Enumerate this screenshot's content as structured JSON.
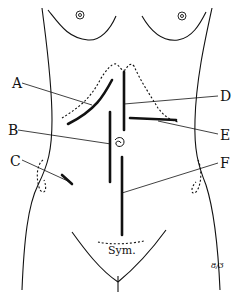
{
  "diagram": {
    "labels": {
      "A": "A",
      "B": "B",
      "C": "C",
      "D": "D",
      "E": "E",
      "F": "F"
    },
    "landmarks": {
      "symphysis": "Sym.",
      "signature": "8/3"
    },
    "colors": {
      "ink": "#111111",
      "background": "#ffffff"
    }
  }
}
